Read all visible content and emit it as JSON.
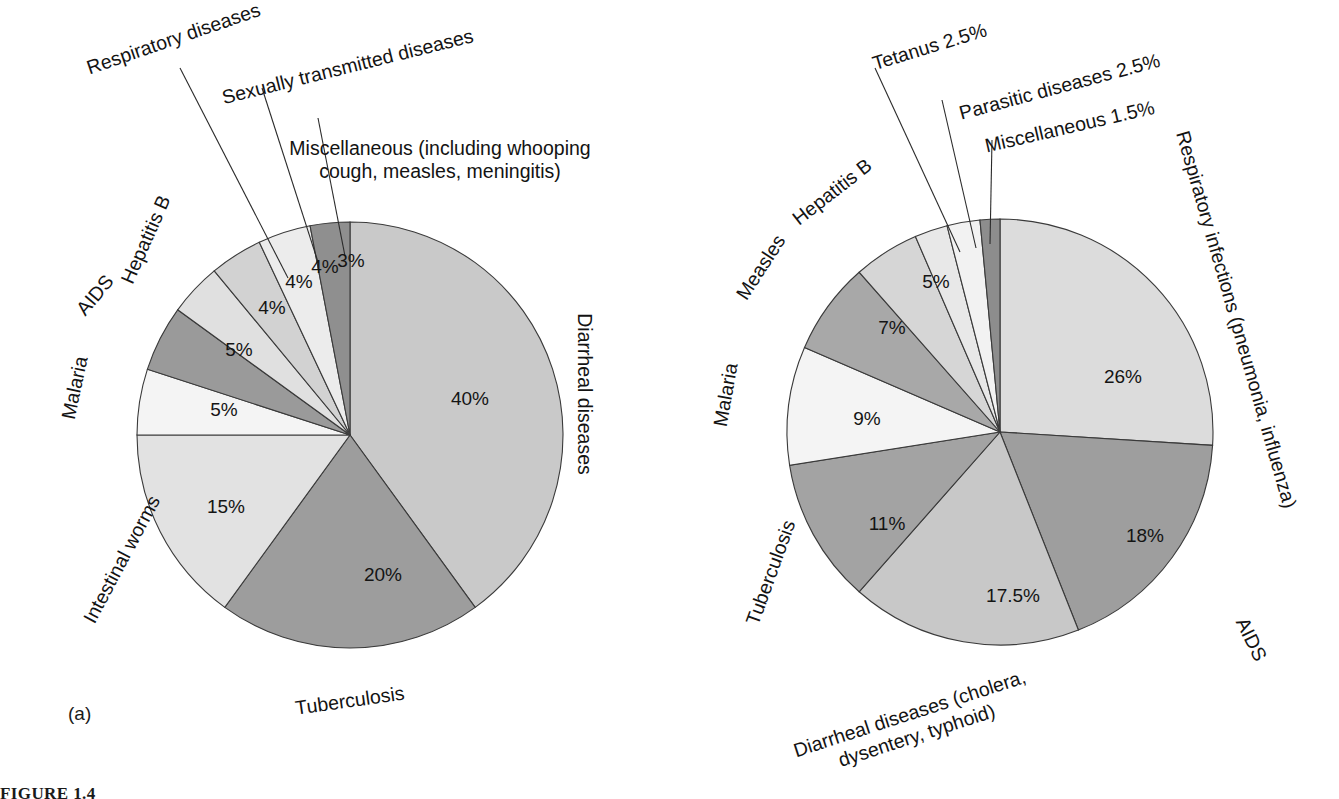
{
  "figure": {
    "caption": "FIGURE 1.4",
    "panel_a_tag": "(a)",
    "panel_b_tag": "(b)"
  },
  "chart_data": [
    {
      "id": "panel-a",
      "type": "pie",
      "title": "",
      "panel_label": "(a)",
      "total": 100,
      "start_angle_deg": -90,
      "direction": "clockwise",
      "center": [
        350,
        435
      ],
      "radius": 213,
      "labels_on_slices": true,
      "legend": "none",
      "grid": false,
      "categories": [
        "Diarrheal diseases",
        "Tuberculosis",
        "Intestinal worms",
        "Malaria",
        "AIDS",
        "Hepatitis B",
        "Respiratory diseases",
        "Sexually transmitted diseases",
        "Miscellaneous (including whooping cough, measles, meningitis)"
      ],
      "values": [
        40,
        20,
        15,
        5,
        5,
        4,
        4,
        4,
        3
      ],
      "value_labels": [
        "40%",
        "20%",
        "15%",
        "5%",
        "5%",
        "4%",
        "4%",
        "4%",
        "3%"
      ],
      "colors": [
        "#c9c9c9",
        "#9d9d9d",
        "#e2e2e2",
        "#f4f4f4",
        "#9a9a9a",
        "#e0e0e0",
        "#d2d2d2",
        "#ececec",
        "#8f8f8f"
      ],
      "slices": [
        {
          "label": "Diarrheal diseases",
          "value": 40,
          "value_label": "40%",
          "color": "#c9c9c9",
          "pct_pos": [
            470,
            400
          ],
          "cat_pos": [
            583,
            394
          ],
          "cat_rotate": 90,
          "leader": null
        },
        {
          "label": "Tuberculosis",
          "value": 20,
          "value_label": "20%",
          "color": "#9d9d9d",
          "pct_pos": [
            383,
            576
          ],
          "cat_pos": [
            350,
            702
          ],
          "cat_rotate": -8,
          "leader": null
        },
        {
          "label": "Intestinal worms",
          "value": 15,
          "value_label": "15%",
          "color": "#e2e2e2",
          "pct_pos": [
            226,
            508
          ],
          "cat_pos": [
            123,
            560
          ],
          "cat_rotate": -62,
          "leader": null
        },
        {
          "label": "Malaria",
          "value": 5,
          "value_label": "5%",
          "color": "#f4f4f4",
          "pct_pos": [
            224,
            411
          ],
          "cat_pos": [
            76,
            388
          ],
          "cat_rotate": -78,
          "leader": null
        },
        {
          "label": "AIDS",
          "value": 5,
          "value_label": "5%",
          "color": "#9a9a9a",
          "pct_pos": [
            239,
            351
          ],
          "cat_pos": [
            96,
            296
          ],
          "cat_rotate": -50,
          "leader": null
        },
        {
          "label": "Hepatitis B",
          "value": 4,
          "value_label": "4%",
          "color": "#e0e0e0",
          "pct_pos": [
            272,
            309
          ],
          "cat_pos": [
            147,
            240
          ],
          "cat_rotate": -66,
          "leader": null
        },
        {
          "label": "Respiratory diseases",
          "value": 4,
          "value_label": "4%",
          "color": "#d2d2d2",
          "pct_pos": [
            299,
            283
          ],
          "cat_pos": [
            174,
            40
          ],
          "cat_rotate": -19,
          "leader": [
            [
              288,
              278
            ],
            [
              180,
              68
            ]
          ]
        },
        {
          "label": "Sexually transmitted diseases",
          "value": 4,
          "value_label": "4%",
          "color": "#ececec",
          "pct_pos": [
            325,
            268
          ],
          "cat_pos": [
            348,
            68
          ],
          "cat_rotate": -14,
          "leader": [
            [
              318,
              262
            ],
            [
              262,
              88
            ]
          ]
        },
        {
          "label": "Miscellaneous (including whooping cough, measles, meningitis)",
          "value": 3,
          "value_label": "3%",
          "color": "#8f8f8f",
          "pct_pos": [
            351,
            262
          ],
          "cat_pos": [
            440,
            150
          ],
          "cat_rotate": 0,
          "leader": [
            [
              345,
              256
            ],
            [
              318,
              118
            ]
          ]
        }
      ],
      "multiline_labels": {
        "Miscellaneous (including whooping cough, measles, meningitis)": [
          "Miscellaneous (including whooping",
          "cough, measles, meningitis)"
        ]
      },
      "curved_labels": {
        "Miscellaneous (including whooping cough, measles, meningitis)": true
      }
    },
    {
      "id": "panel-b",
      "type": "pie",
      "title": "",
      "panel_label": "(b)",
      "total": 100,
      "start_angle_deg": -90,
      "direction": "clockwise",
      "center": [
        330,
        432
      ],
      "radius": 213,
      "labels_on_slices": true,
      "legend": "none",
      "grid": false,
      "categories": [
        "Respiratory infections (pneumonia, influenza)",
        "AIDS",
        "Diarrheal diseases (cholera, dysentery, typhoid)",
        "Tuberculosis",
        "Malaria",
        "Measles",
        "Hepatitis B",
        "Tetanus",
        "Parasitic diseases",
        "Miscellaneous"
      ],
      "values": [
        26,
        18,
        17.5,
        11,
        9,
        7,
        5,
        2.5,
        2.5,
        1.5
      ],
      "value_labels": [
        "26%",
        "18%",
        "17.5%",
        "11%",
        "9%",
        "7%",
        "5%",
        "2.5%",
        "2.5%",
        "1.5%"
      ],
      "colors": [
        "#dcdcdc",
        "#9e9e9e",
        "#c8c8c8",
        "#a3a3a3",
        "#f4f4f4",
        "#a8a8a8",
        "#d6d6d6",
        "#e8e8e8",
        "#f2f2f2",
        "#8d8d8d"
      ],
      "slices": [
        {
          "label": "Respiratory infections (pneumonia, influenza)",
          "value": 26,
          "value_label": "26%",
          "color": "#dcdcdc",
          "pct_pos": [
            453,
            378
          ],
          "cat_pos": [
            565,
            320
          ],
          "cat_rotate": 74,
          "leader": null
        },
        {
          "label": "AIDS",
          "value": 18,
          "value_label": "18%",
          "color": "#9e9e9e",
          "pct_pos": [
            475,
            537
          ],
          "cat_pos": [
            580,
            640
          ],
          "cat_rotate": 64,
          "leader": null
        },
        {
          "label": "Diarrheal diseases (cholera, dysentery, typhoid)",
          "value": 17.5,
          "value_label": "17.5%",
          "color": "#c8c8c8",
          "pct_pos": [
            343,
            597
          ],
          "cat_pos": [
            240,
            715
          ],
          "cat_rotate": -18,
          "leader": null
        },
        {
          "label": "Tuberculosis",
          "value": 11,
          "value_label": "11%",
          "color": "#a3a3a3",
          "pct_pos": [
            217,
            525
          ],
          "cat_pos": [
            102,
            573
          ],
          "cat_rotate": -70,
          "leader": null
        },
        {
          "label": "Malaria",
          "value": 9,
          "value_label": "9%",
          "color": "#f4f4f4",
          "pct_pos": [
            197,
            420
          ],
          "cat_pos": [
            57,
            395
          ],
          "cat_rotate": -80,
          "leader": null
        },
        {
          "label": "Measles",
          "value": 7,
          "value_label": "7%",
          "color": "#a8a8a8",
          "pct_pos": [
            222,
            329
          ],
          "cat_pos": [
            92,
            268
          ],
          "cat_rotate": -57,
          "leader": null
        },
        {
          "label": "Hepatitis B",
          "value": 5,
          "value_label": "5%",
          "color": "#d6d6d6",
          "pct_pos": [
            266,
            283
          ],
          "cat_pos": [
            163,
            193
          ],
          "cat_rotate": -38,
          "leader": null
        },
        {
          "label": "Tetanus",
          "value": 2.5,
          "value_label": "2.5%",
          "color": "#e8e8e8",
          "pct_pos": [
            296,
            260
          ],
          "cat_pos": [
            260,
            48
          ],
          "cat_rotate": -17,
          "leader": [
            [
              290,
              252
            ],
            [
              205,
              68
            ]
          ]
        },
        {
          "label": "Parasitic diseases",
          "value": 2.5,
          "value_label": "2.5%",
          "color": "#f2f2f2",
          "pct_pos": [
            312,
            252
          ],
          "cat_pos": [
            390,
            88
          ],
          "cat_rotate": -15,
          "leader": [
            [
              306,
              248
            ],
            [
              272,
              100
            ]
          ]
        },
        {
          "label": "Miscellaneous",
          "value": 1.5,
          "value_label": "1.5%",
          "color": "#8d8d8d",
          "pct_pos": [
            324,
            248
          ],
          "cat_pos": [
            400,
            128
          ],
          "cat_rotate": -13,
          "leader": [
            [
              320,
              244
            ],
            [
              322,
              140
            ]
          ]
        }
      ],
      "multiline_labels": {
        "Diarrheal diseases (cholera, dysentery, typhoid)": [
          "Diarrheal diseases (cholera,",
          "dysentery, typhoid)"
        ]
      },
      "external_labels": [
        {
          "text": "Tetanus 2.5%",
          "pos": [
            260,
            48
          ],
          "rotate": -17
        },
        {
          "text": "Parasitic diseases 2.5%",
          "pos": [
            390,
            88
          ],
          "rotate": -15
        },
        {
          "text": "Miscellaneous 1.5%",
          "pos": [
            400,
            128
          ],
          "rotate": -13
        }
      ]
    }
  ],
  "panel_a_external_labels": [
    {
      "text": "Respiratory diseases",
      "pos": [
        174,
        40
      ],
      "rotate": -19
    },
    {
      "text": "Sexually transmitted diseases",
      "pos": [
        348,
        68
      ],
      "rotate": -14
    }
  ],
  "accent_colors": {
    "stroke": "#3a3a3a",
    "text": "#141414",
    "background": "#ffffff"
  }
}
